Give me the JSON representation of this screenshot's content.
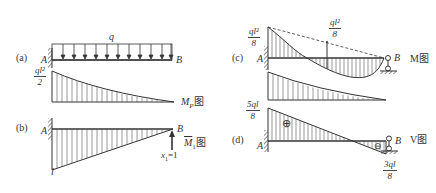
{
  "panels": {
    "a": {
      "tag": "(a)",
      "load_label": "q",
      "point_a": "A",
      "point_b": "B",
      "moment_value": {
        "num": "ql²",
        "den": "2"
      },
      "diagram_label": "M",
      "diagram_sub": "P",
      "diagram_suffix": "图"
    },
    "b": {
      "tag": "(b)",
      "point_a": "A",
      "point_b": "B",
      "moment_value": "l",
      "force_label": "x",
      "force_sub": "1",
      "force_eq": "=1",
      "diagram_label": "M",
      "diagram_sub": "1",
      "diagram_suffix": "图"
    },
    "c": {
      "tag": "(c)",
      "point_a": "A",
      "point_b": "B",
      "left_value": {
        "num": "ql²",
        "den": "8"
      },
      "mid_value": {
        "num": "ql²",
        "den": "8"
      },
      "diagram_label": "M图"
    },
    "d": {
      "tag": "(d)",
      "point_a": "A",
      "point_b": "B",
      "left_value": {
        "num": "5ql",
        "den": "8"
      },
      "right_value": {
        "num": "3ql",
        "den": "8"
      },
      "positive_sign": "⊕",
      "negative_sign": "⊖",
      "diagram_label": "V图"
    }
  }
}
